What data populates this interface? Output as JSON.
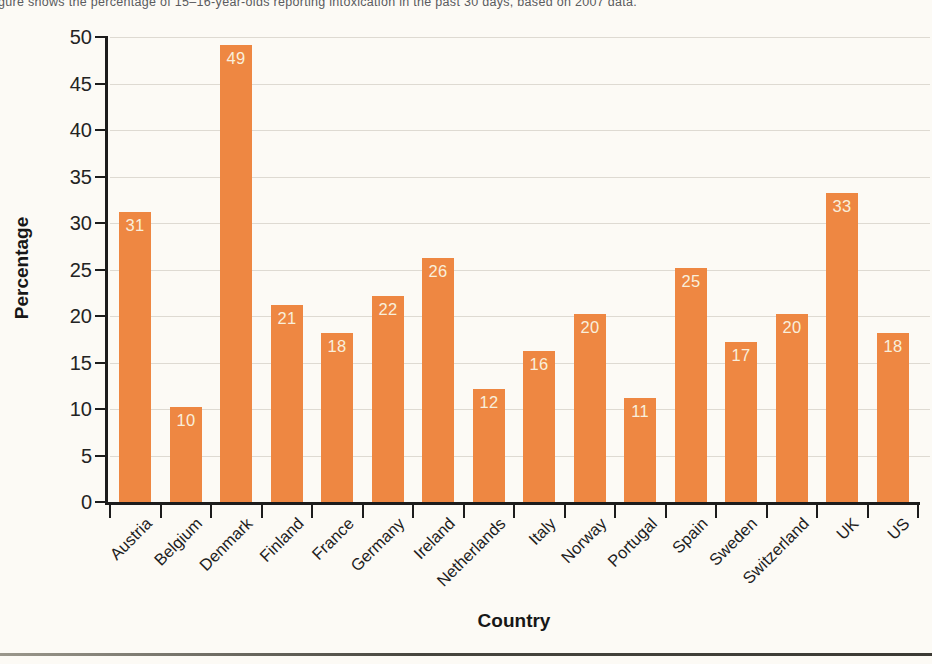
{
  "caption": "gure shows the percentage of 15–16-year-olds reporting intoxication in the past 30 days, based on 2007 data.",
  "chart_data": {
    "type": "bar",
    "title": "",
    "categories": [
      "Austria",
      "Belgium",
      "Denmark",
      "Finland",
      "France",
      "Germany",
      "Ireland",
      "Netherlands",
      "Italy",
      "Norway",
      "Portugal",
      "Spain",
      "Sweden",
      "Switzerland",
      "UK",
      "US"
    ],
    "values": [
      31,
      10,
      49,
      21,
      18,
      22,
      26,
      12,
      16,
      20,
      11,
      25,
      17,
      20,
      33,
      18
    ],
    "xlabel": "Country",
    "ylabel": "Percentage",
    "ylim": [
      0,
      50
    ],
    "ytick_step": 5,
    "grid": "horizontal-every-5",
    "legend": "none",
    "bar_color": "#EE8742",
    "bar_label_color": "#F9EFDC",
    "axis_color": "#1C1C1C",
    "gridline_color": "#DEDAD2",
    "background_color": "#FCFAF5"
  }
}
